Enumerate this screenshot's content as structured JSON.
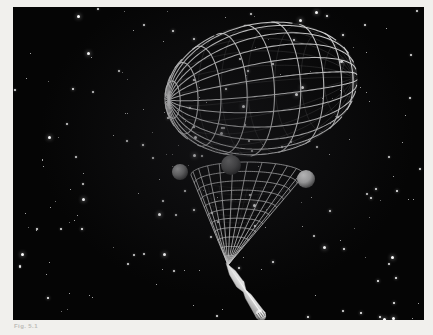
{
  "page": {
    "background_color": "#f1f0ed",
    "plate_background": "#050505"
  },
  "caption": {
    "label": "Fig. 5.1",
    "text": ""
  },
  "scene": {
    "title": "Wireframe ellipsoid with projection cone and spacecraft over starfield",
    "colors": {
      "wireframe": "#e8e8e8",
      "wireframe_back": "#6d6d6d",
      "cone_mesh": "#dcdcdc",
      "sphere_left": "#8a8a8a",
      "sphere_center": "#6a6a6a",
      "sphere_right": "#c8c8c8",
      "rocket_body": "#efefef",
      "plume": "#ffffff",
      "star": "#ffffff",
      "space": "#050505"
    },
    "objects": [
      {
        "name": "wireframe-ellipsoid",
        "kind": "ellipsoid",
        "center_x": 248,
        "center_y": 82,
        "radius_x": 98,
        "radius_y": 68,
        "meridians": 24,
        "parallels": 11,
        "pole_x": 152,
        "pole_y": 70
      },
      {
        "name": "projection-cone",
        "kind": "cone",
        "apex_x": 215,
        "apex_y": 258,
        "rim_left_x": 178,
        "rim_right_x": 291,
        "rim_y": 168,
        "rim_depth": 13,
        "mesh_rows": 11,
        "mesh_cols": 12
      },
      {
        "name": "sphere-left",
        "kind": "sphere",
        "cx": 167,
        "cy": 165,
        "r": 8,
        "shade": "#8a8a8a"
      },
      {
        "name": "sphere-center",
        "kind": "sphere",
        "cx": 218,
        "cy": 158,
        "r": 10,
        "shade": "#6a6a6a"
      },
      {
        "name": "sphere-right",
        "kind": "sphere",
        "cx": 293,
        "cy": 172,
        "r": 9,
        "shade": "#c8c8c8"
      },
      {
        "name": "spacecraft",
        "kind": "rocket",
        "nose_x": 213,
        "nose_y": 256,
        "tail_x": 249,
        "tail_y": 310,
        "length": 64,
        "plume": true
      }
    ],
    "star_count": 210
  }
}
